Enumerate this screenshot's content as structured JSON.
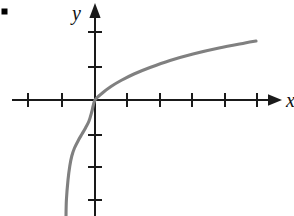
{
  "figure": {
    "bullet_marker": "▪",
    "x_axis_label": "x",
    "y_axis_label": "y",
    "curve_color": "#808080",
    "axis_color": "#1a1a1a",
    "background_color": "#ffffff"
  },
  "chart_data": {
    "type": "line",
    "title": "",
    "xlabel": "x",
    "ylabel": "y",
    "grid": false,
    "legend": null,
    "function": "y = log(x + 1)",
    "origin_px": [
      95,
      100
    ],
    "x_tick_spacing_px": 32.5,
    "y_tick_spacing_px": 33,
    "xlim": [
      -2.9,
      5.6
    ],
    "ylim": [
      -3.0,
      2.9
    ],
    "x_ticks": [
      -2,
      -1,
      1,
      2,
      3,
      4,
      5
    ],
    "y_ticks": [
      -3,
      -2,
      -1,
      1,
      2
    ],
    "x_tick_positions_px": [
      28,
      62,
      127,
      160,
      192,
      225,
      257
    ],
    "y_tick_positions_px": [
      200,
      167,
      135,
      67,
      32
    ],
    "x": [
      -0.95,
      -0.9,
      -0.82,
      -0.75,
      -0.68,
      -0.6,
      -0.5,
      -0.4,
      -0.3,
      -0.2,
      -0.1,
      0.0,
      0.25,
      0.5,
      0.8,
      1.2,
      1.7,
      2.3,
      3.0,
      3.8,
      4.6,
      5.0
    ],
    "y": [
      -3.0,
      -2.3,
      -1.71,
      -1.39,
      -1.14,
      -0.92,
      -0.69,
      -0.51,
      -0.36,
      -0.22,
      -0.11,
      0.0,
      0.22,
      0.41,
      0.59,
      0.79,
      0.99,
      1.19,
      1.39,
      1.57,
      1.72,
      1.79
    ],
    "series": [
      {
        "name": "y = log(x + 1)",
        "color": "#808080",
        "points_px": [
          [
            66,
            216
          ],
          [
            66.4,
            200
          ],
          [
            68,
            180
          ],
          [
            69.8,
            166
          ],
          [
            71.8,
            156
          ],
          [
            74.5,
            148
          ],
          [
            78.5,
            140
          ],
          [
            82.0,
            134
          ],
          [
            85.5,
            128
          ],
          [
            89.0,
            121
          ],
          [
            92.0,
            111
          ],
          [
            95,
            100
          ],
          [
            103,
            92.5
          ],
          [
            111,
            86.5
          ],
          [
            121,
            80.5
          ],
          [
            134,
            74.0
          ],
          [
            150,
            67.5
          ],
          [
            170,
            60.5
          ],
          [
            193,
            54.0
          ],
          [
            219,
            48.0
          ],
          [
            245,
            43.0
          ],
          [
            256,
            41.0
          ]
        ]
      }
    ]
  }
}
